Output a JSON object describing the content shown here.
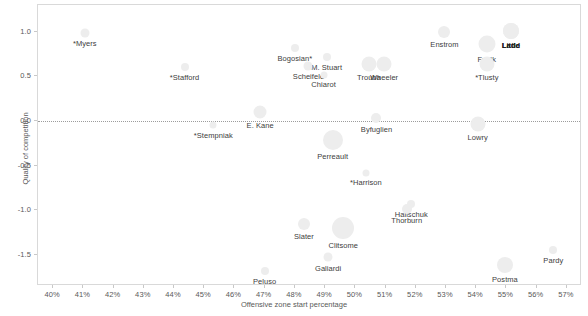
{
  "chart_data": {
    "type": "scatter",
    "title": "",
    "subtitle": "",
    "xlabel": "Offensive zone start percentage",
    "ylabel": "Quality of competition",
    "xlim": [
      39.5,
      57.5
    ],
    "ylim": [
      -1.85,
      1.3
    ],
    "xticks": [
      "40%",
      "41%",
      "42%",
      "43%",
      "44%",
      "45%",
      "46%",
      "47%",
      "48%",
      "49%",
      "50%",
      "51%",
      "52%",
      "53%",
      "54%",
      "55%",
      "56%",
      "57%"
    ],
    "xtick_values": [
      40,
      41,
      42,
      43,
      44,
      45,
      46,
      47,
      48,
      49,
      50,
      51,
      52,
      53,
      54,
      55,
      56,
      57
    ],
    "yticks": [
      "1.0",
      "0.5",
      "0.0",
      "-0.5",
      "-1.0",
      "-1.5"
    ],
    "ytick_values": [
      1.0,
      0.5,
      0.0,
      -0.5,
      -1.0,
      -1.5
    ],
    "grid": false,
    "legend": "none",
    "reference_line": {
      "axis": "y",
      "value": 0.0,
      "style": "dotted",
      "color": "#9c9c9c"
    },
    "bubble_color": "#ededed",
    "label_color": "#404040",
    "axis_color": "#595959",
    "points": [
      {
        "label": "*Myers",
        "x": 41.05,
        "y": 0.99,
        "size": 9,
        "label_dx": 0,
        "label_dy": 0,
        "bold": false
      },
      {
        "label": "*Stafford",
        "x": 44.35,
        "y": 0.6,
        "size": 8,
        "label_dx": 0,
        "label_dy": 0,
        "bold": false
      },
      {
        "label": "Bogosian*",
        "x": 48.0,
        "y": 0.82,
        "size": 8,
        "label_dx": 0,
        "label_dy": 0,
        "bold": false
      },
      {
        "label": "M. Stuart",
        "x": 49.05,
        "y": 0.72,
        "size": 8,
        "label_dx": 0,
        "label_dy": 0,
        "bold": false
      },
      {
        "label": "Scheifele",
        "x": 48.45,
        "y": 0.62,
        "size": 9,
        "label_dx": 0,
        "label_dy": 0,
        "bold": false
      },
      {
        "label": "Chiarot",
        "x": 48.95,
        "y": 0.52,
        "size": 7,
        "label_dx": 0,
        "label_dy": 0,
        "bold": false
      },
      {
        "label": "Trouba",
        "x": 50.45,
        "y": 0.64,
        "size": 15,
        "label_dx": 0,
        "label_dy": 0,
        "bold": false
      },
      {
        "label": "Wheeler",
        "x": 50.95,
        "y": 0.64,
        "size": 15,
        "label_dx": 0,
        "label_dy": 0,
        "bold": false
      },
      {
        "label": "Enstrom",
        "x": 52.95,
        "y": 1.0,
        "size": 12,
        "label_dx": 0,
        "label_dy": 0,
        "bold": false
      },
      {
        "label": "Frolik",
        "x": 54.35,
        "y": 0.86,
        "size": 17,
        "label_dx": 0,
        "label_dy": 0,
        "bold": false
      },
      {
        "label": "Ladd",
        "x": 55.15,
        "y": 1.01,
        "size": 16,
        "label_dx": 0,
        "label_dy": 0,
        "bold": true
      },
      {
        "label": "Little",
        "x": 55.15,
        "y": 1.01,
        "size": 16,
        "label_dx": 0,
        "label_dy": 0,
        "bold": true
      },
      {
        "label": "*Tlusty",
        "x": 54.35,
        "y": 0.64,
        "size": 15,
        "label_dx": 0,
        "label_dy": 0,
        "bold": false
      },
      {
        "label": "E. Kane",
        "x": 46.85,
        "y": 0.1,
        "size": 13,
        "label_dx": 0,
        "label_dy": 0,
        "bold": false
      },
      {
        "label": "Byfuglien",
        "x": 50.7,
        "y": 0.03,
        "size": 10,
        "label_dx": 0,
        "label_dy": 0,
        "bold": false
      },
      {
        "label": "Lowry",
        "x": 54.05,
        "y": -0.03,
        "size": 15,
        "label_dx": 0,
        "label_dy": 0,
        "bold": false
      },
      {
        "label": "*Stempniak",
        "x": 45.3,
        "y": -0.05,
        "size": 7,
        "label_dx": 0,
        "label_dy": 0,
        "bold": false
      },
      {
        "label": "Perreault",
        "x": 49.25,
        "y": -0.21,
        "size": 20,
        "label_dx": 0,
        "label_dy": 0,
        "bold": false
      },
      {
        "label": "*Harrison",
        "x": 50.35,
        "y": -0.58,
        "size": 7,
        "label_dx": 0,
        "label_dy": 0,
        "bold": false
      },
      {
        "label": "Halischuk",
        "x": 51.85,
        "y": -0.93,
        "size": 8,
        "label_dx": 0,
        "label_dy": 0,
        "bold": false
      },
      {
        "label": "Thorburn",
        "x": 51.7,
        "y": -0.99,
        "size": 10,
        "label_dx": 0,
        "label_dy": 0,
        "bold": false
      },
      {
        "label": "Slater",
        "x": 48.3,
        "y": -1.16,
        "size": 12,
        "label_dx": 0,
        "label_dy": 0,
        "bold": false
      },
      {
        "label": "Clitsome",
        "x": 49.6,
        "y": -1.2,
        "size": 22,
        "label_dx": 0,
        "label_dy": 0,
        "bold": false
      },
      {
        "label": "Pardy",
        "x": 56.55,
        "y": -1.45,
        "size": 8,
        "label_dx": 0,
        "label_dy": 0,
        "bold": false
      },
      {
        "label": "Galiardi",
        "x": 49.1,
        "y": -1.53,
        "size": 9,
        "label_dx": 0,
        "label_dy": 0,
        "bold": false
      },
      {
        "label": "Postma",
        "x": 54.95,
        "y": -1.62,
        "size": 16,
        "label_dx": 0,
        "label_dy": 0,
        "bold": false
      },
      {
        "label": "Peluso",
        "x": 47.0,
        "y": -1.68,
        "size": 8,
        "label_dx": 0,
        "label_dy": 0,
        "bold": false
      }
    ]
  }
}
